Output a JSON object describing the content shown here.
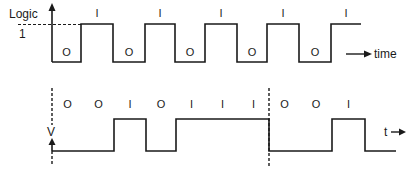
{
  "top_diagram": {
    "y_label": "Logic",
    "level_label": "1",
    "x_label": "time",
    "bits": [
      "O",
      "I",
      "O",
      "I",
      "O",
      "I",
      "O",
      "I",
      "O",
      "I"
    ],
    "edges_x": [
      52,
      81,
      113,
      145,
      175,
      205,
      237,
      267,
      299,
      331,
      361
    ],
    "high_y": 24,
    "low_y": 62,
    "bit_label_high_y": 8,
    "bit_label_low_y": 47
  },
  "bottom_diagram": {
    "y_label": "V",
    "x_label": "t",
    "bits": [
      "O",
      "O",
      "I",
      "O",
      "I",
      "I",
      "I",
      "O",
      "O",
      "I"
    ],
    "edges_x": [
      52,
      83,
      114,
      146,
      176,
      207,
      238,
      269,
      300,
      332,
      365
    ],
    "end_x": 396,
    "high_y": 119,
    "low_y": 151,
    "bit_label_y": 99,
    "dashed_markers_x": [
      52,
      269
    ]
  },
  "colors": {
    "line": "#1a1a1a",
    "background": "#ffffff"
  }
}
